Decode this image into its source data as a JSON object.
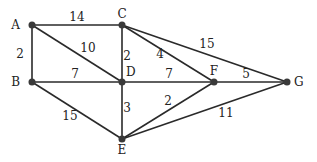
{
  "graph": {
    "nodes": [
      {
        "id": "A",
        "label": "A"
      },
      {
        "id": "B",
        "label": "B"
      },
      {
        "id": "C",
        "label": "C"
      },
      {
        "id": "D",
        "label": "D"
      },
      {
        "id": "E",
        "label": "E"
      },
      {
        "id": "F",
        "label": "F"
      },
      {
        "id": "G",
        "label": "G"
      }
    ],
    "edges": [
      {
        "from": "A",
        "to": "C",
        "weight": "14"
      },
      {
        "from": "A",
        "to": "B",
        "weight": "2"
      },
      {
        "from": "A",
        "to": "D",
        "weight": "10"
      },
      {
        "from": "C",
        "to": "D",
        "weight": "2"
      },
      {
        "from": "C",
        "to": "F",
        "weight": "4"
      },
      {
        "from": "C",
        "to": "G",
        "weight": "15"
      },
      {
        "from": "B",
        "to": "D",
        "weight": "7"
      },
      {
        "from": "D",
        "to": "F",
        "weight": "7"
      },
      {
        "from": "F",
        "to": "G",
        "weight": "5"
      },
      {
        "from": "B",
        "to": "E",
        "weight": "15"
      },
      {
        "from": "D",
        "to": "E",
        "weight": "3"
      },
      {
        "from": "E",
        "to": "F",
        "weight": "2"
      },
      {
        "from": "E",
        "to": "G",
        "weight": "11"
      }
    ]
  }
}
